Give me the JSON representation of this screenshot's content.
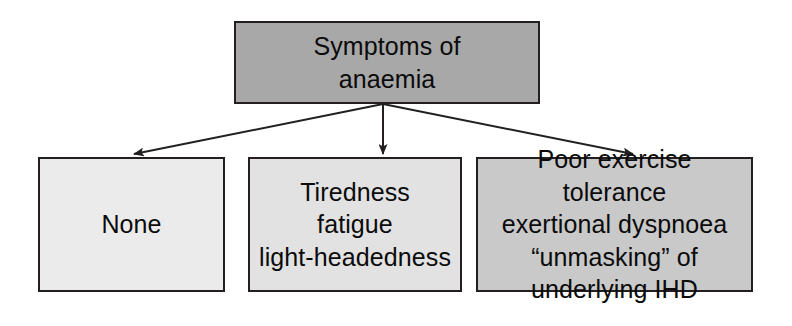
{
  "diagram": {
    "title": "Symptoms of anaemia",
    "type": "flowchart",
    "orientation": "top-down",
    "background_color": "#ffffff",
    "line_color": "#231f20",
    "nodes": [
      {
        "id": "root",
        "label": "Symptoms of\nanaemia",
        "fill_color": "#a8a8a8",
        "border_color": "#231f20",
        "text_color": "#0b0b0b",
        "role": "root"
      },
      {
        "id": "none",
        "label": "None",
        "fill_color": "#ebebeb",
        "border_color": "#231f20",
        "text_color": "#0b0b0b",
        "role": "outcome"
      },
      {
        "id": "mild",
        "label": "Tiredness\nfatigue\nlight-headedness",
        "fill_color": "#e2e2e2",
        "border_color": "#231f20",
        "text_color": "#0b0b0b",
        "role": "outcome"
      },
      {
        "id": "severe",
        "label": "Poor exercise tolerance\nexertional dyspnoea\n“unmasking” of\nunderlying IHD",
        "fill_color": "#c9c9c9",
        "border_color": "#231f20",
        "text_color": "#0b0b0b",
        "role": "outcome"
      }
    ],
    "edges": [
      {
        "id": "edge-root-none",
        "from": "root",
        "to": "none",
        "arrowhead": "filled-triangle"
      },
      {
        "id": "edge-root-mild",
        "from": "root",
        "to": "mild",
        "arrowhead": "filled-triangle"
      },
      {
        "id": "edge-root-severe",
        "from": "root",
        "to": "severe",
        "arrowhead": "filled-triangle"
      }
    ]
  }
}
